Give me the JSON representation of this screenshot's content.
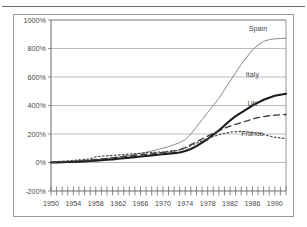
{
  "figure": {
    "frame_label": "chart-frame",
    "background": "#ffffff",
    "border_color": "#9a9a9a",
    "rule_color": "#6b6b6b"
  },
  "chart_data": {
    "type": "line",
    "title": "",
    "xlabel": "",
    "ylabel": "",
    "xlim": [
      1950,
      1992
    ],
    "ylim": [
      -200,
      1000
    ],
    "grid": true,
    "legend_position": "inline-right",
    "y_ticks": [
      -200,
      0,
      200,
      400,
      600,
      800,
      1000
    ],
    "y_tick_labels": [
      "-200%",
      "0%",
      "200%",
      "400%",
      "600%",
      "800%",
      "1000%"
    ],
    "x_ticks": [
      1950,
      1954,
      1958,
      1962,
      1966,
      1970,
      1974,
      1978,
      1982,
      1986,
      1990
    ],
    "x_tick_labels": [
      "1950",
      "1954",
      "1958",
      "1962",
      "1966",
      "1970",
      "1974",
      "1978",
      "1982",
      "1986",
      "1990"
    ],
    "x_minor_step": 1,
    "x": [
      1950,
      1951,
      1952,
      1953,
      1954,
      1955,
      1956,
      1957,
      1958,
      1959,
      1960,
      1961,
      1962,
      1963,
      1964,
      1965,
      1966,
      1967,
      1968,
      1969,
      1970,
      1971,
      1972,
      1973,
      1974,
      1975,
      1976,
      1977,
      1978,
      1979,
      1980,
      1981,
      1982,
      1983,
      1984,
      1985,
      1986,
      1987,
      1988,
      1989,
      1990,
      1991,
      1992
    ],
    "series": [
      {
        "name": "Spain",
        "color": "#8a8a8a",
        "width": 1.0,
        "dash": "none",
        "label_x": 1987,
        "label_y": 925,
        "values": [
          2,
          4,
          6,
          8,
          10,
          12,
          14,
          17,
          20,
          24,
          28,
          33,
          38,
          44,
          50,
          57,
          64,
          72,
          80,
          90,
          100,
          112,
          125,
          140,
          160,
          200,
          250,
          300,
          350,
          400,
          450,
          510,
          570,
          630,
          690,
          740,
          790,
          825,
          850,
          862,
          868,
          870,
          872
        ]
      },
      {
        "name": "Italy",
        "color": "#1c1c1c",
        "width": 2.1,
        "dash": "none",
        "label_x": 1986,
        "label_y": 600,
        "values": [
          0,
          1,
          2,
          3,
          4,
          6,
          8,
          10,
          13,
          16,
          19,
          22,
          26,
          30,
          34,
          38,
          42,
          46,
          50,
          54,
          58,
          62,
          66,
          70,
          80,
          95,
          115,
          140,
          165,
          195,
          225,
          260,
          295,
          325,
          350,
          375,
          400,
          420,
          440,
          455,
          468,
          476,
          482
        ]
      },
      {
        "name": "UK",
        "color": "#3a3a3a",
        "width": 1.3,
        "dash": "6,4",
        "label_x": 1986,
        "label_y": 400,
        "values": [
          1,
          2,
          4,
          6,
          8,
          11,
          14,
          17,
          21,
          25,
          29,
          33,
          38,
          42,
          46,
          50,
          54,
          58,
          62,
          66,
          70,
          76,
          82,
          90,
          105,
          125,
          145,
          165,
          185,
          205,
          222,
          240,
          255,
          268,
          280,
          292,
          305,
          315,
          322,
          328,
          332,
          335,
          337
        ]
      },
      {
        "name": "France",
        "color": "#4a4a4a",
        "width": 1.2,
        "dash": "1.6,2.4",
        "label_x": 1986,
        "label_y": 185,
        "values": [
          3,
          6,
          9,
          12,
          15,
          18,
          22,
          26,
          40,
          44,
          47,
          50,
          53,
          56,
          59,
          62,
          65,
          68,
          70,
          72,
          74,
          78,
          82,
          88,
          100,
          118,
          135,
          152,
          168,
          182,
          195,
          205,
          212,
          216,
          218,
          216,
          212,
          205,
          196,
          186,
          178,
          172,
          168
        ]
      }
    ]
  }
}
